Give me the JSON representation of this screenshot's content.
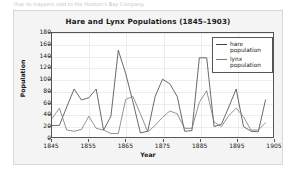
{
  "page": {
    "snippet_text": "that its trappers sold to the Hudson's Bay Company."
  },
  "figure": {
    "title": "Hare and Lynx Populations (1845–1903)",
    "xlabel": "Year",
    "ylabel": "Population",
    "legend": {
      "position": "top-right",
      "entries": [
        {
          "label": "hare population",
          "color": "#444444"
        },
        {
          "label": "lynx population",
          "color": "#777777"
        }
      ]
    },
    "ytick_labels": [
      "180",
      "160",
      "140",
      "120",
      "100",
      "80",
      "60",
      "40",
      "20",
      "0"
    ],
    "xtick_labels": [
      "1845",
      "1855",
      "1865",
      "1875",
      "1885",
      "1895",
      "1905"
    ]
  },
  "chart_data": {
    "type": "line",
    "title": "Hare and Lynx Populations (1845–1903)",
    "xlabel": "Year",
    "ylabel": "Population",
    "xlim": [
      1845,
      1905
    ],
    "ylim": [
      0,
      180
    ],
    "xticks": [
      1845,
      1855,
      1865,
      1875,
      1885,
      1895,
      1905
    ],
    "yticks": [
      0,
      20,
      40,
      60,
      80,
      100,
      120,
      140,
      160,
      180
    ],
    "grid": true,
    "legend_position": "upper right",
    "x": [
      1845,
      1847,
      1849,
      1851,
      1853,
      1855,
      1857,
      1859,
      1861,
      1863,
      1865,
      1867,
      1869,
      1871,
      1873,
      1875,
      1877,
      1879,
      1881,
      1883,
      1885,
      1887,
      1889,
      1891,
      1893,
      1895,
      1897,
      1899,
      1901,
      1903
    ],
    "series": [
      {
        "name": "hare population",
        "color": "#444444",
        "values": [
          20,
          20,
          52,
          83,
          64,
          68,
          83,
          12,
          36,
          150,
          110,
          60,
          7,
          10,
          70,
          100,
          92,
          70,
          10,
          11,
          137,
          137,
          18,
          22,
          52,
          83,
          18,
          10,
          9,
          65
        ]
      },
      {
        "name": "lynx population",
        "color": "#777777",
        "values": [
          32,
          50,
          12,
          10,
          13,
          36,
          15,
          12,
          6,
          6,
          65,
          70,
          40,
          9,
          20,
          34,
          45,
          40,
          15,
          15,
          60,
          80,
          26,
          18,
          37,
          50,
          35,
          12,
          12,
          25
        ]
      }
    ]
  }
}
